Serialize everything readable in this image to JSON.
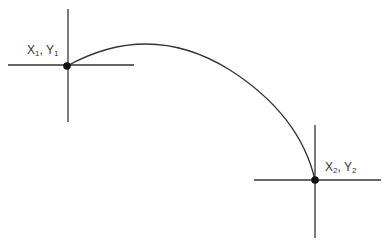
{
  "diagram": {
    "stroke_color": "#333333",
    "point1": {
      "label_x": "X",
      "sub_x": "1",
      "label_y": "Y",
      "sub_y": "1",
      "cx": 67,
      "cy": 66
    },
    "point2": {
      "label_x": "X",
      "sub_x": "2",
      "label_y": "Y",
      "sub_y": "2",
      "cx": 315,
      "cy": 180
    },
    "separator": ", "
  }
}
